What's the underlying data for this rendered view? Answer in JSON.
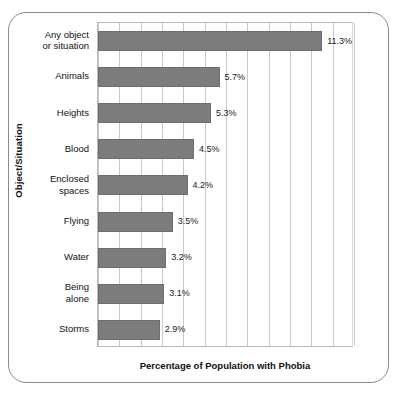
{
  "chart_data": {
    "type": "bar",
    "orientation": "horizontal",
    "title": "",
    "xlabel": "Percentage of Population with Phobia",
    "ylabel": "Object/Situation",
    "xlim": [
      0,
      12
    ],
    "grid": true,
    "gridline_count": 12,
    "legend": "none",
    "bar_color": "#7c7c7c",
    "categories": [
      "Any object or situation",
      "Animals",
      "Heights",
      "Blood",
      "Enclosed spaces",
      "Flying",
      "Water",
      "Being alone",
      "Storms"
    ],
    "values": [
      11.3,
      5.7,
      5.3,
      4.5,
      4.2,
      3.5,
      3.2,
      3.1,
      2.9
    ],
    "data_labels": [
      "11.3%",
      "5.7%",
      "5.3%",
      "4.5%",
      "4.2%",
      "3.5%",
      "3.2%",
      "3.1%",
      "2.9%"
    ],
    "category_lines": [
      [
        "Any object",
        "or situation"
      ],
      [
        "Animals"
      ],
      [
        "Heights"
      ],
      [
        "Blood"
      ],
      [
        "Enclosed",
        "spaces"
      ],
      [
        "Flying"
      ],
      [
        "Water"
      ],
      [
        "Being",
        "alone"
      ],
      [
        "Storms"
      ]
    ]
  },
  "axes": {
    "x_title": "Percentage of Population with Phobia",
    "y_title": "Object/Situation"
  },
  "labels": {
    "cat_0": "Any object\nor situation",
    "cat_1": "Animals",
    "cat_2": "Heights",
    "cat_3": "Blood",
    "cat_4": "Enclosed\nspaces",
    "cat_5": "Flying",
    "cat_6": "Water",
    "cat_7": "Being\nalone",
    "cat_8": "Storms"
  },
  "values_text": {
    "v0": "11.3%",
    "v1": "5.7%",
    "v2": "5.3%",
    "v3": "4.5%",
    "v4": "4.2%",
    "v5": "3.5%",
    "v6": "3.2%",
    "v7": "3.1%",
    "v8": "2.9%"
  },
  "colors": {
    "bar": "#7c7c7c",
    "gridline": "#c9c9c9",
    "frame": "#8a8a8a",
    "text": "#111111"
  }
}
